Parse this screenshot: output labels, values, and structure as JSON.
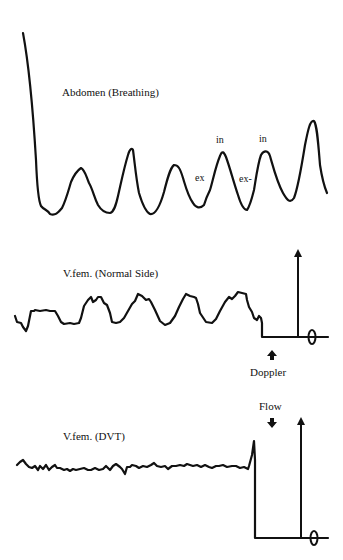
{
  "panels": [
    {
      "id": "abdomen",
      "label": "Abdomen (Breathing)",
      "annotations": {
        "in1": "in",
        "in2": "in",
        "ex1": "ex",
        "ex2": "ex-"
      }
    },
    {
      "id": "vfem-normal",
      "label": "V.fem. (Normal Side)",
      "marker_label": "Doppler",
      "zero_symbol": "0"
    },
    {
      "id": "vfem-dvt",
      "label": "V.fem. (DVT)",
      "marker_label": "Flow",
      "zero_symbol": "0"
    }
  ],
  "colors": {
    "line": "#111111",
    "background": "#ffffff"
  }
}
